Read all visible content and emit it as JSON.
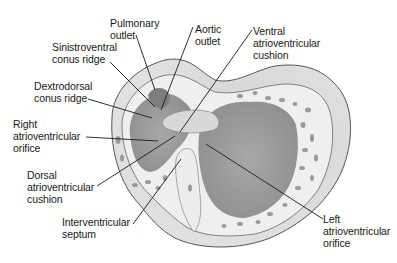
{
  "diagram": {
    "colors": {
      "background": "#ffffff",
      "outer_wall": "#d9d9d9",
      "inner_wall": "#ebebeb",
      "trabeculae": "#9a9a9a",
      "outline": "#555555",
      "leader_line": "#1a1a1a",
      "text": "#1a1a1a"
    },
    "labels": [
      {
        "id": "pulmonary-outlet",
        "text": "Pulmonary\noutlet"
      },
      {
        "id": "aortic-outlet",
        "text": "Aortic\noutlet"
      },
      {
        "id": "sinistroventral-conus-ridge",
        "text": "Sinistroventral\nconus ridge"
      },
      {
        "id": "ventral-atrioventricular-cushion",
        "text": "Ventral\natrioventricular\ncushion"
      },
      {
        "id": "dextrodorsal-conus-ridge",
        "text": "Dextrodorsal\nconus ridge"
      },
      {
        "id": "right-atrioventricular-orifice",
        "text": "Right\natrioventricular\norifice"
      },
      {
        "id": "dorsal-atrioventricular-cushion",
        "text": "Dorsal\natrioventricular\ncushion"
      },
      {
        "id": "interventricular-septum",
        "text": "Interventricular\nseptum"
      },
      {
        "id": "left-atrioventricular-orifice",
        "text": "Left\natrioventricular\norifice"
      }
    ]
  }
}
